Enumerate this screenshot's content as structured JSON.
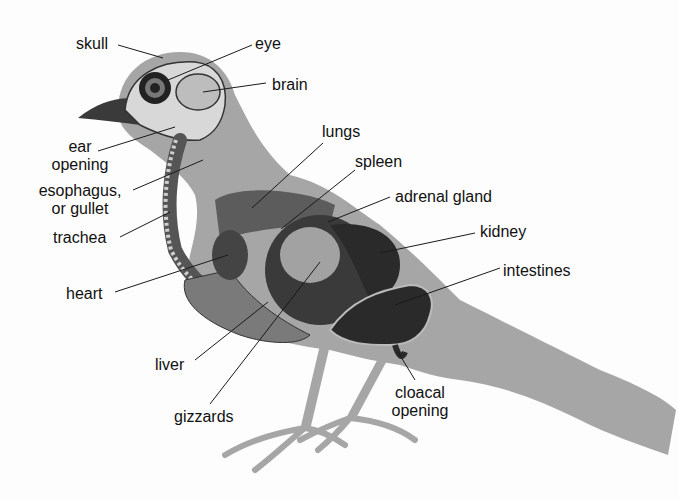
{
  "diagram": {
    "colors": {
      "silhouette": "#a6a6a6",
      "organ_dark": "#2a2a2a",
      "organ_mid": "#5a5a5a",
      "organ_light": "#d8d8d8",
      "label_text": "#111111",
      "leader_line": "#1a1a1a"
    },
    "labels": {
      "skull": "skull",
      "eye": "eye",
      "brain": "brain",
      "ear_line1": "ear",
      "ear_line2": "opening",
      "esophagus_line1": "esophagus,",
      "esophagus_line2": "or gullet",
      "trachea": "trachea",
      "lungs": "lungs",
      "spleen": "spleen",
      "adrenal_gland": "adrenal gland",
      "kidney": "kidney",
      "intestines": "intestines",
      "heart": "heart",
      "liver": "liver",
      "gizzards": "gizzards",
      "cloacal_line1": "cloacal",
      "cloacal_line2": "opening"
    }
  }
}
